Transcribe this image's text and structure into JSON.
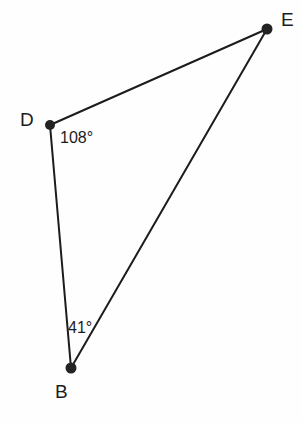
{
  "figure": {
    "type": "triangle-diagram",
    "width": 302,
    "height": 423,
    "background_color": "#fefefe",
    "stroke_color": "#1c1c1c",
    "vertex_color": "#232323",
    "stroke_width": 2,
    "vertex_radius": 5
  },
  "vertices": [
    {
      "id": "D",
      "label": "D",
      "x": 50,
      "y": 125,
      "label_x": 20,
      "label_y": 110
    },
    {
      "id": "E",
      "label": "E",
      "x": 267,
      "y": 29,
      "label_x": 281,
      "label_y": 10
    },
    {
      "id": "B",
      "label": "B",
      "x": 71,
      "y": 368,
      "label_x": 55,
      "label_y": 382
    }
  ],
  "edges": [
    {
      "id": "DE",
      "from": "D",
      "to": "E"
    },
    {
      "id": "DB",
      "from": "D",
      "to": "B"
    },
    {
      "id": "BE",
      "from": "B",
      "to": "E"
    }
  ],
  "angles": [
    {
      "id": "angle-D",
      "at": "D",
      "value": 108,
      "text": "108°",
      "x": 60,
      "y": 130
    },
    {
      "id": "angle-B",
      "at": "B",
      "value": 41,
      "text": "41°",
      "x": 68,
      "y": 320
    }
  ]
}
